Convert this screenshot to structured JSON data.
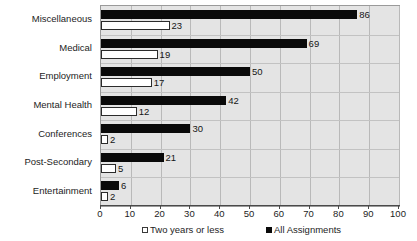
{
  "chart_data": {
    "type": "bar",
    "orientation": "horizontal",
    "title": "",
    "xlabel": "",
    "ylabel": "",
    "xlim": [
      0,
      100
    ],
    "xticks": [
      0,
      10,
      20,
      30,
      40,
      50,
      60,
      70,
      80,
      90,
      100
    ],
    "grid": true,
    "legend_position": "bottom",
    "categories": [
      "Miscellaneous",
      "Medical",
      "Employment",
      "Mental Health",
      "Conferences",
      "Post-Secondary",
      "Entertainment"
    ],
    "series": [
      {
        "name": "All Assignments",
        "marker": "filled-square",
        "color": "#0a0a0a",
        "values": [
          86,
          69,
          50,
          42,
          30,
          21,
          6
        ]
      },
      {
        "name": "Two years or less",
        "marker": "open-square",
        "color": "#ffffff",
        "values": [
          23,
          19,
          17,
          12,
          2,
          5,
          2
        ]
      }
    ]
  },
  "legend": {
    "items": [
      {
        "label": "Two years or less",
        "swatch": "open-square-icon"
      },
      {
        "label": "All Assignments",
        "swatch": "filled-square-icon"
      }
    ]
  },
  "colors": {
    "plot_background": "#e4e4e4",
    "gridline": "#b9b9b9",
    "axis": "#4a4a4a",
    "bar_dark": "#0a0a0a",
    "bar_light": "#ffffff",
    "text": "#1d1d1d"
  }
}
